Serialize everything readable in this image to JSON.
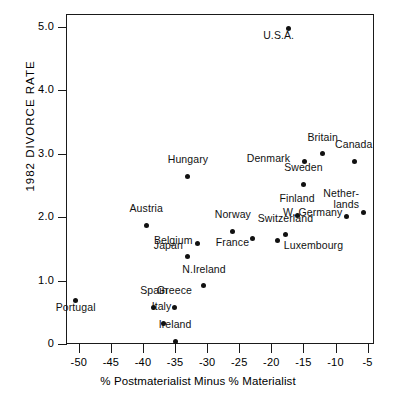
{
  "chart_data": {
    "type": "scatter",
    "title": "",
    "xlabel": "% Postmaterialist Minus % Materialist",
    "ylabel": "1982 DIVORCE RATE",
    "xlim": [
      -52,
      -4
    ],
    "ylim": [
      0,
      5.2
    ],
    "grid": false,
    "legend": "none",
    "xticks": [
      -50,
      -45,
      -40,
      -35,
      -30,
      -25,
      -20,
      -15,
      -10,
      -5
    ],
    "xtick_labels": [
      "-50",
      "-45",
      "-40",
      "-35",
      "-30",
      "-25",
      "-20",
      "-15",
      "-10",
      "-5"
    ],
    "yticks": [
      0,
      1.0,
      2.0,
      3.0,
      4.0,
      5.0
    ],
    "ytick_labels": [
      "0",
      "1.0",
      "2.0",
      "3.0",
      "4.0",
      "5.0"
    ],
    "points": [
      {
        "label": "U.S.A.",
        "x": -17.3,
        "y": 4.97,
        "lx": -10,
        "ly": 9,
        "align": "center"
      },
      {
        "label": "Canada",
        "x": -7.0,
        "y": 2.88,
        "lx": -1,
        "ly": -4,
        "align": "center"
      },
      {
        "label": "Britain",
        "x": -12.0,
        "y": 3.0,
        "lx": 0,
        "ly": -4,
        "align": "center"
      },
      {
        "label": "Denmark",
        "x": -14.9,
        "y": 2.87,
        "lx": -14,
        "ly": 1,
        "align": "right"
      },
      {
        "label": "Sweden",
        "x": -15.0,
        "y": 2.52,
        "lx": 0,
        "ly": -4,
        "align": "center"
      },
      {
        "label": "Hungary",
        "x": -33.0,
        "y": 2.64,
        "lx": 0,
        "ly": -4,
        "align": "center"
      },
      {
        "label": "Netherlands",
        "x": -5.7,
        "y": 2.08,
        "lx": -4,
        "ly": -8,
        "align": "right"
      },
      {
        "label": "W. Germany",
        "x": -8.3,
        "y": 2.01,
        "lx": -4,
        "ly": 1,
        "align": "right"
      },
      {
        "label": "Finland",
        "x": -16.0,
        "y": 2.03,
        "lx": 0,
        "ly": -4,
        "align": "center"
      },
      {
        "label": "Switzerland",
        "x": -17.8,
        "y": 1.72,
        "lx": 0,
        "ly": -4,
        "align": "center"
      },
      {
        "label": "Luxembourg",
        "x": -19.0,
        "y": 1.63,
        "lx": 6,
        "ly": 9,
        "align": "left"
      },
      {
        "label": "Norway",
        "x": -26.0,
        "y": 1.78,
        "lx": 0,
        "ly": -4,
        "align": "center"
      },
      {
        "label": "France",
        "x": -23.0,
        "y": 1.67,
        "lx": -3,
        "ly": 9,
        "align": "right"
      },
      {
        "label": "Austria",
        "x": -39.5,
        "y": 1.87,
        "lx": 0,
        "ly": -4,
        "align": "center"
      },
      {
        "label": "Belgium",
        "x": -31.5,
        "y": 1.58,
        "lx": -5,
        "ly": 1,
        "align": "right"
      },
      {
        "label": "Japan",
        "x": -33.0,
        "y": 1.38,
        "lx": -5,
        "ly": -6,
        "align": "right"
      },
      {
        "label": "N.Ireland",
        "x": -30.5,
        "y": 0.92,
        "lx": 0,
        "ly": -4,
        "align": "center"
      },
      {
        "label": "Portugal",
        "x": -50.5,
        "y": 0.68,
        "lx": 0,
        "ly": 9,
        "align": "center"
      },
      {
        "label": "Spain",
        "x": -38.3,
        "y": 0.58,
        "lx": 0,
        "ly": -4,
        "align": "center"
      },
      {
        "label": "Greece",
        "x": -35.1,
        "y": 0.58,
        "lx": 0,
        "ly": -4,
        "align": "center"
      },
      {
        "label": "Italy",
        "x": -36.8,
        "y": 0.33,
        "lx": -2,
        "ly": -4,
        "align": "center"
      },
      {
        "label": "Ireland",
        "x": -35.0,
        "y": 0.04,
        "lx": 0,
        "ly": -4,
        "align": "center"
      }
    ]
  }
}
